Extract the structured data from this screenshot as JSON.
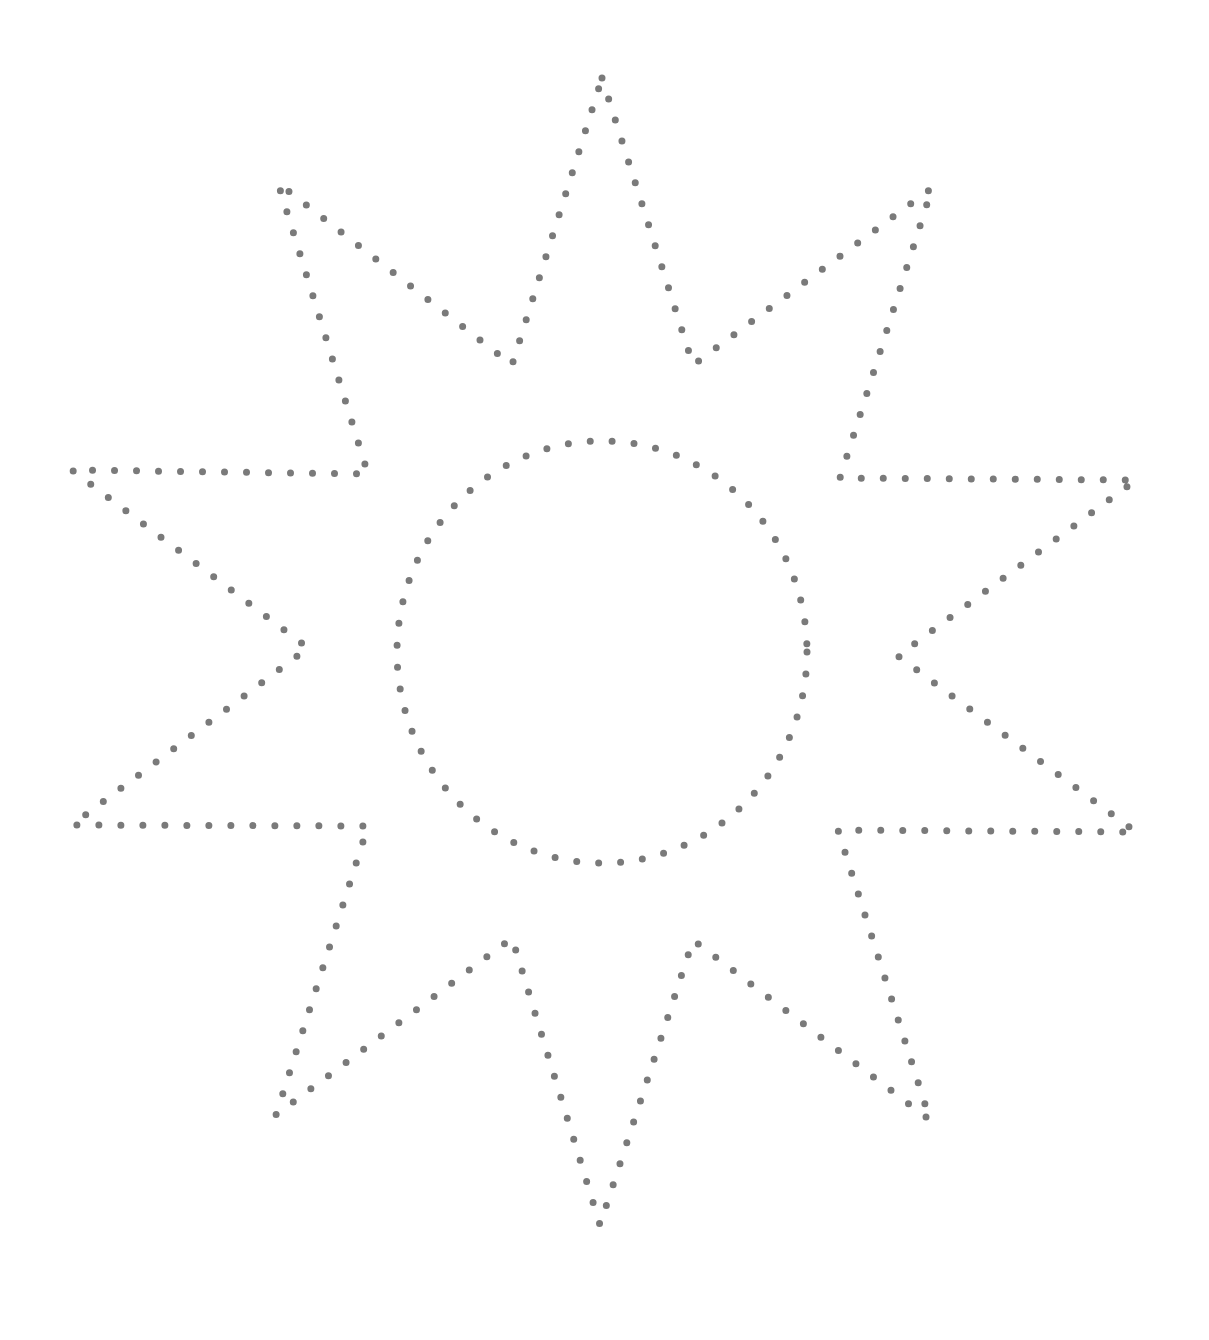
{
  "worksheet": {
    "title": "Dotted sun tracing outline",
    "dot_color": "#7a7a7a",
    "background": "#ffffff",
    "dot_radius": 3.5,
    "dot_spacing": 22,
    "star": {
      "points": [
        [
          602,
          78
        ],
        [
          693,
          365
        ],
        [
          932,
          188
        ],
        [
          840,
          478
        ],
        [
          1136,
          480
        ],
        [
          898,
          656
        ],
        [
          1136,
          832
        ],
        [
          838,
          830
        ],
        [
          930,
          1120
        ],
        [
          693,
          940
        ],
        [
          600,
          1225
        ],
        [
          512,
          938
        ],
        [
          276,
          1115
        ],
        [
          368,
          826
        ],
        [
          72,
          825
        ],
        [
          308,
          648
        ],
        [
          72,
          470
        ],
        [
          368,
          474
        ],
        [
          278,
          183
        ],
        [
          512,
          365
        ]
      ]
    },
    "circle": {
      "cx": 602,
      "cy": 652,
      "rx": 205,
      "ry": 211
    }
  }
}
